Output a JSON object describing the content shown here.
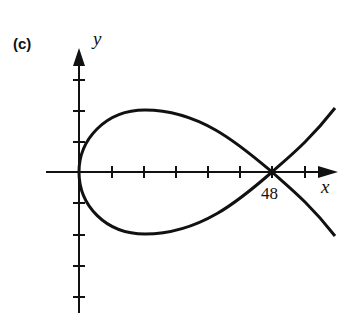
{
  "panel_label": "(c)",
  "axes": {
    "x_label": "x",
    "y_label": "y",
    "x_tick_label": "48"
  },
  "curve": {
    "description": "Loop curve crossing itself on the x-axis at x = 48, starting at origin",
    "crossing_x": 48,
    "color": "#111111"
  }
}
